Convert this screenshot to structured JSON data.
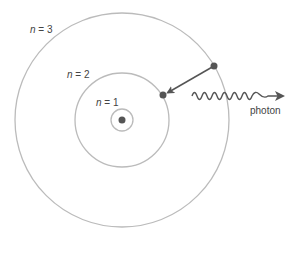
{
  "diagram": {
    "nucleus": {
      "cx": 122,
      "cy": 120,
      "r": 3.5
    },
    "orbits": [
      {
        "n": "1",
        "r": 11,
        "label_var": "n",
        "label_eq": " = 1",
        "label_x": 96,
        "label_y": 106
      },
      {
        "n": "2",
        "r": 47,
        "label_var": "n",
        "label_eq": " = 2",
        "label_x": 67,
        "label_y": 78
      },
      {
        "n": "3",
        "r": 107,
        "label_var": "n",
        "label_eq": " = 3",
        "label_x": 30,
        "label_y": 33
      }
    ],
    "electron_start": {
      "x": 214,
      "y": 66
    },
    "electron_end": {
      "x": 163,
      "y": 95
    },
    "photon_label": "photon",
    "colors": {
      "orbit": "#bbbbbb",
      "particle": "#555555",
      "arrow": "#555555",
      "text": "#444444",
      "background": "#ffffff"
    }
  }
}
